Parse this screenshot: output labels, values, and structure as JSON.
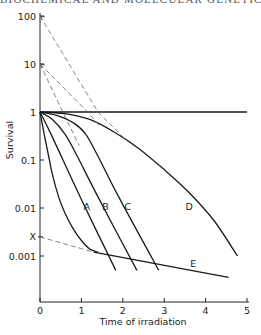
{
  "header": {
    "title": "BIOCHEMICAL AND MOLECULAR GENETICS"
  },
  "chart_data": {
    "type": "line",
    "title": "",
    "xlabel": "Time of irradiation",
    "ylabel": "Survival",
    "xlim": [
      0,
      5
    ],
    "ylim": [
      0.0003,
      100
    ],
    "yscale": "log",
    "grid": false,
    "x_ticks": [
      "0",
      "1",
      "2",
      "3",
      "4",
      "5"
    ],
    "y_ticks": [
      "100",
      "10",
      "1",
      "0.1",
      "0.01",
      "0.001"
    ],
    "y_extra_marks": [
      {
        "label": "X",
        "value": 0.0025
      }
    ],
    "series": [
      {
        "name": "reference",
        "style": "solid",
        "points": [
          [
            0,
            1
          ],
          [
            5,
            1
          ]
        ]
      },
      {
        "name": "biphasic",
        "style": "solid",
        "points": [
          [
            0,
            1
          ],
          [
            0.1,
            0.35
          ],
          [
            0.2,
            0.13
          ],
          [
            0.3,
            0.05
          ],
          [
            0.45,
            0.017
          ],
          [
            0.6,
            0.008
          ],
          [
            0.8,
            0.0037
          ],
          [
            1.0,
            0.0021
          ],
          [
            1.2,
            0.0014
          ],
          [
            1.4,
            0.0012
          ]
        ]
      },
      {
        "name": "A",
        "label": "A",
        "style": "solid",
        "points": [
          [
            0,
            1
          ],
          [
            0.3,
            0.3
          ],
          [
            1.0,
            0.015
          ],
          [
            1.83,
            0.0005
          ]
        ]
      },
      {
        "name": "B",
        "label": "B",
        "style": "solid",
        "points": [
          [
            0,
            1
          ],
          [
            0.3,
            0.7
          ],
          [
            0.6,
            0.35
          ],
          [
            0.9,
            0.12
          ],
          [
            1.4,
            0.017
          ],
          [
            2.34,
            0.0005
          ]
        ]
      },
      {
        "name": "C",
        "label": "C",
        "style": "solid",
        "points": [
          [
            0,
            1
          ],
          [
            0.4,
            0.85
          ],
          [
            0.8,
            0.6
          ],
          [
            1.1,
            0.35
          ],
          [
            1.4,
            0.12
          ],
          [
            1.9,
            0.017
          ],
          [
            2.87,
            0.0005
          ]
        ]
      },
      {
        "name": "D",
        "label": "D",
        "style": "solid",
        "points": [
          [
            0,
            1
          ],
          [
            0.6,
            0.92
          ],
          [
            1.2,
            0.7
          ],
          [
            1.8,
            0.38
          ],
          [
            2.4,
            0.17
          ],
          [
            3.0,
            0.063
          ],
          [
            3.6,
            0.021
          ],
          [
            4.2,
            0.0055
          ],
          [
            4.77,
            0.001
          ]
        ]
      },
      {
        "name": "E",
        "label": "E",
        "style": "solid",
        "points": [
          [
            1.3,
            0.0012
          ],
          [
            4.55,
            0.00036
          ]
        ]
      },
      {
        "name": "E-extrapolation",
        "style": "dashed",
        "points": [
          [
            0,
            0.0025
          ],
          [
            1.3,
            0.0012
          ]
        ]
      },
      {
        "name": "B-extrapolation",
        "style": "dashed",
        "points": [
          [
            0,
            10
          ],
          [
            0.55,
            1
          ],
          [
            0.95,
            0.2
          ]
        ]
      },
      {
        "name": "C-extrapolation",
        "style": "dashed",
        "points": [
          [
            0,
            10
          ],
          [
            1.15,
            1
          ],
          [
            1.45,
            0.5
          ]
        ]
      },
      {
        "name": "D-extrapolation",
        "style": "dashed",
        "points": [
          [
            0,
            100
          ],
          [
            1.4,
            1
          ],
          [
            2.1,
            0.25
          ]
        ]
      }
    ],
    "annotations": [
      {
        "text": "A",
        "t": 1.13,
        "s": 0.009
      },
      {
        "text": "B",
        "t": 1.58,
        "s": 0.009
      },
      {
        "text": "C",
        "t": 2.12,
        "s": 0.009
      },
      {
        "text": "D",
        "t": 3.6,
        "s": 0.009
      },
      {
        "text": "E",
        "t": 3.7,
        "s": 0.0006
      }
    ]
  }
}
